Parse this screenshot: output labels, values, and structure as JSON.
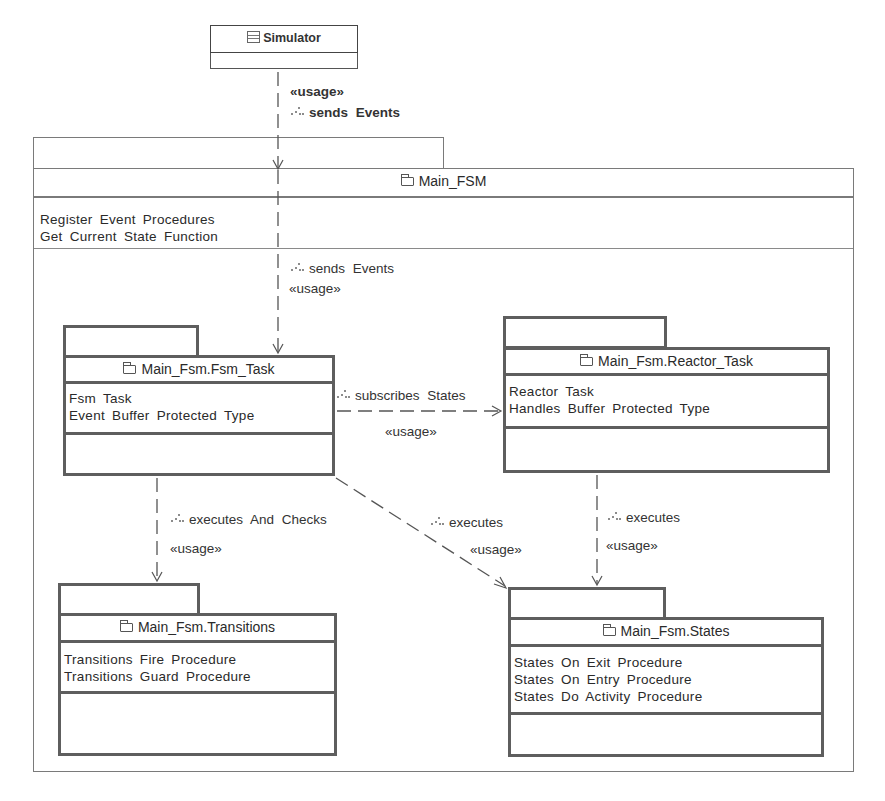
{
  "diagram": {
    "type": "UML package diagram",
    "nodes": {
      "simulator": {
        "name": "Simulator",
        "icon": "class-icon"
      },
      "main_fsm": {
        "name": "Main_FSM",
        "icon": "folder-icon",
        "attributes": [
          "Register  Event  Procedures",
          "Get  Current  State  Function"
        ]
      },
      "fsm_task": {
        "name": "Main_Fsm.Fsm_Task",
        "icon": "folder-icon",
        "attributes": [
          "Fsm  Task",
          "Event  Buffer  Protected  Type"
        ]
      },
      "reactor_task": {
        "name": "Main_Fsm.Reactor_Task",
        "icon": "folder-icon",
        "attributes": [
          "Reactor  Task",
          "Handles  Buffer  Protected  Type"
        ]
      },
      "transitions": {
        "name": "Main_Fsm.Transitions",
        "icon": "folder-icon",
        "attributes": [
          "Transitions  Fire  Procedure",
          "Transitions  Guard  Procedure"
        ]
      },
      "states": {
        "name": "Main_Fsm.States",
        "icon": "folder-icon",
        "attributes": [
          "States  On  Exit  Procedure",
          "States  On  Entry  Procedure",
          "States  Do  Activity  Procedure"
        ]
      }
    },
    "edges": {
      "sim_to_main": {
        "stereotype": "«usage»",
        "label": "sends  Events",
        "from": "Simulator",
        "to": "Main_FSM"
      },
      "main_to_fsm": {
        "stereotype": "«usage»",
        "label": "sends  Events",
        "from": "Main_FSM",
        "to": "Main_Fsm.Fsm_Task"
      },
      "fsm_to_reactor": {
        "stereotype": "«usage»",
        "label": "subscribes  States",
        "from": "Main_Fsm.Fsm_Task",
        "to": "Main_Fsm.Reactor_Task"
      },
      "fsm_to_transitions": {
        "stereotype": "«usage»",
        "label": "executes  And  Checks",
        "from": "Main_Fsm.Fsm_Task",
        "to": "Main_Fsm.Transitions"
      },
      "fsm_to_states": {
        "stereotype": "«usage»",
        "label": "executes",
        "from": "Main_Fsm.Fsm_Task",
        "to": "Main_Fsm.States"
      },
      "reactor_to_states": {
        "stereotype": "«usage»",
        "label": "executes",
        "from": "Main_Fsm.Reactor_Task",
        "to": "Main_Fsm.States"
      }
    },
    "colors": {
      "line": "#5e5e5e",
      "thin_line": "#7a7a7a",
      "text": "#2a2a2a",
      "background": "#ffffff"
    }
  }
}
